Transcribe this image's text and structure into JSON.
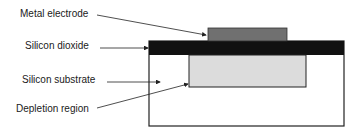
{
  "diagram": {
    "labels": {
      "metal_electrode": "Metal electrode",
      "silicon_dioxide": "Silicon dioxide",
      "silicon_substrate": "Silicon substrate",
      "depletion_region": "Depletion region"
    },
    "colors": {
      "metal_electrode": "#707070",
      "silicon_dioxide": "#111111",
      "silicon_substrate": "#ffffff",
      "depletion_region": "#dcdcdc",
      "outline": "#222222"
    }
  }
}
